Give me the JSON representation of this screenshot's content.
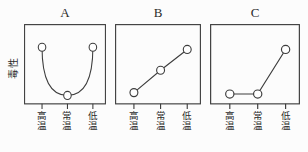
{
  "figure": {
    "y_axis_label": "毒性",
    "colors": {
      "line": "#3d3d3d",
      "text": "#2b2b2b",
      "background": "#fcfcfc",
      "marker_fill": "#ffffff"
    }
  },
  "chart_data": [
    {
      "type": "line",
      "title": "A",
      "ylabel": "毒性",
      "categories": [
        "高温",
        "常温",
        "低温"
      ],
      "values": [
        0.75,
        0.08,
        0.75
      ],
      "curve": "u-shape",
      "marker": "circle",
      "ylim": [
        0,
        1
      ],
      "grid": false,
      "legend": "none"
    },
    {
      "type": "line",
      "title": "B",
      "categories": [
        "高温",
        "常温",
        "低温"
      ],
      "values": [
        0.12,
        0.43,
        0.72
      ],
      "curve": "linear",
      "marker": "circle",
      "ylim": [
        0,
        1
      ],
      "grid": false,
      "legend": "none"
    },
    {
      "type": "line",
      "title": "C",
      "categories": [
        "高温",
        "常温",
        "低温"
      ],
      "values": [
        0.1,
        0.1,
        0.72
      ],
      "curve": "linear",
      "marker": "circle",
      "ylim": [
        0,
        1
      ],
      "grid": false,
      "legend": "none"
    }
  ]
}
